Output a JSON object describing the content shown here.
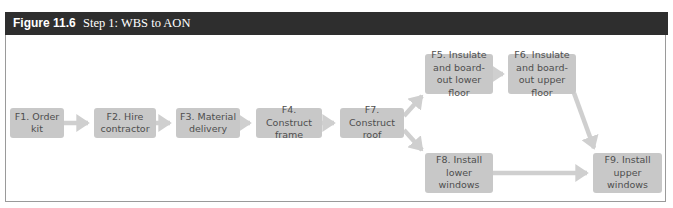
{
  "figure": {
    "label": "Figure 11.6",
    "title": "Step 1: WBS to AON"
  },
  "colors": {
    "header_bg": "#2e2e2e",
    "node_fill": "#c8c8c8",
    "node_text": "#4e4e4e",
    "arrow": "#cfcfcf",
    "frame_border": "#9a9a9a"
  },
  "nodes": {
    "f1": {
      "id": "F1",
      "label": "F1. Order kit"
    },
    "f2": {
      "id": "F2",
      "label": "F2. Hire contractor"
    },
    "f3": {
      "id": "F3",
      "label": "F3. Material delivery"
    },
    "f4": {
      "id": "F4",
      "label": "F4. Construct frame"
    },
    "f5": {
      "id": "F5",
      "label": "F5. Insulate and board-out lower floor"
    },
    "f6": {
      "id": "F6",
      "label": "F6. Insulate and board-out upper floor"
    },
    "f7": {
      "id": "F7",
      "label": "F7. Construct roof"
    },
    "f8": {
      "id": "F8",
      "label": "F8. Install lower windows"
    },
    "f9": {
      "id": "F9",
      "label": "F9. Install upper windows"
    }
  },
  "edges": [
    {
      "from": "F1",
      "to": "F2"
    },
    {
      "from": "F2",
      "to": "F3"
    },
    {
      "from": "F3",
      "to": "F4"
    },
    {
      "from": "F4",
      "to": "F7"
    },
    {
      "from": "F7",
      "to": "F5"
    },
    {
      "from": "F7",
      "to": "F8"
    },
    {
      "from": "F5",
      "to": "F6"
    },
    {
      "from": "F6",
      "to": "F9"
    },
    {
      "from": "F8",
      "to": "F9"
    }
  ]
}
